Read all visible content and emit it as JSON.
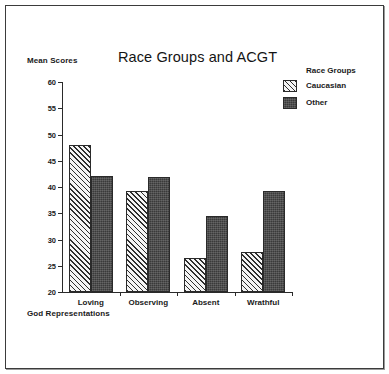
{
  "figure": {
    "background_color": "#ffffff",
    "frame_color": "#3b3b3b"
  },
  "chart_data": {
    "type": "bar",
    "title": "Race Groups and ACGT",
    "xlabel": "God Representations",
    "ylabel": "Mean Scores",
    "categories": [
      "Loving",
      "Observing",
      "Absent",
      "Wrathful"
    ],
    "series": [
      {
        "name": "Caucasian",
        "fill": "diagonal-hatch",
        "color": "#f4f4f4",
        "values": [
          48.0,
          39.3,
          26.5,
          27.6
        ]
      },
      {
        "name": "Other",
        "fill": "dark-solid",
        "color": "#3a3a3a",
        "values": [
          42.1,
          41.9,
          34.4,
          39.2
        ]
      }
    ],
    "ylim": [
      20,
      60
    ],
    "yticks": [
      20,
      25,
      30,
      35,
      40,
      45,
      50,
      55,
      60
    ],
    "ytick_labels": [
      "20",
      "25",
      "30",
      "35",
      "40",
      "45",
      "50",
      "55",
      "60"
    ],
    "grid": false,
    "legend": {
      "title": "Race Groups",
      "position": "top-right",
      "entries": [
        "Caucasian",
        "Other"
      ]
    }
  }
}
